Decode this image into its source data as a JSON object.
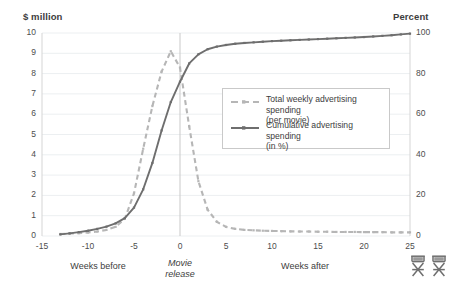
{
  "axes": {
    "left_title": "$ million",
    "right_title": "Percent",
    "left_ticks": [
      "10",
      "9",
      "8",
      "7",
      "6",
      "5",
      "4",
      "3",
      "2",
      "1",
      "0"
    ],
    "right_ticks": [
      "100",
      "80",
      "60",
      "40",
      "20",
      "0"
    ],
    "x_ticks": [
      "-15",
      "-10",
      "-5",
      "0",
      "5",
      "10",
      "15",
      "20",
      "25"
    ]
  },
  "annotations": {
    "weeks_before": "Weeks before",
    "movie_release_line1": "Movie",
    "movie_release_line2": "release",
    "weeks_after": "Weeks after",
    "chair_icon_1": "director-chair-icon",
    "chair_icon_2": "director-chair-icon"
  },
  "legend": {
    "items": [
      {
        "label_line1": "Total weekly advertising spending",
        "label_line2": "(per movie)",
        "style": "dashed",
        "color": "#b6b6b6"
      },
      {
        "label_line1": "Cumulative advertising spending",
        "label_line2": "(in %)",
        "style": "solid",
        "color": "#6e6e6e"
      }
    ]
  },
  "colors": {
    "weekly_line": "#b6b6b6",
    "cumulative_line": "#6e6e6e",
    "grid": "#eceff1",
    "axis": "#d5d5d5",
    "release_line": "#c9c9c9",
    "background": "#ffffff"
  },
  "chart_data": {
    "type": "line",
    "title": "",
    "subtitle": "",
    "xlabel": "Weeks relative to movie release",
    "ylabel": "$ million",
    "y2label": "Percent",
    "xlim": [
      -15,
      25
    ],
    "ylim": [
      0,
      10
    ],
    "y2lim": [
      0,
      100
    ],
    "grid": true,
    "legend_position": "upper-right",
    "reference_line_x": 0,
    "x": [
      -13,
      -12,
      -11,
      -10,
      -9,
      -8,
      -7,
      -6,
      -5,
      -4,
      -3,
      -2,
      -1,
      0,
      1,
      2,
      3,
      4,
      5,
      6,
      7,
      8,
      9,
      10,
      11,
      12,
      13,
      14,
      15,
      16,
      17,
      18,
      19,
      20,
      21,
      22,
      23,
      24,
      25
    ],
    "series": [
      {
        "name": "Total weekly advertising spending (per movie)",
        "unit": "$ million",
        "axis": "left",
        "style": "dashed",
        "values": [
          0.1,
          0.12,
          0.14,
          0.17,
          0.22,
          0.3,
          0.45,
          0.85,
          2.1,
          4.3,
          6.4,
          8.1,
          9.1,
          8.3,
          5.4,
          2.7,
          1.3,
          0.7,
          0.45,
          0.35,
          0.3,
          0.28,
          0.26,
          0.25,
          0.24,
          0.23,
          0.22,
          0.22,
          0.21,
          0.21,
          0.2,
          0.2,
          0.2,
          0.19,
          0.19,
          0.19,
          0.18,
          0.18,
          0.18
        ]
      },
      {
        "name": "Cumulative advertising spending (in %)",
        "unit": "percent",
        "axis": "right",
        "style": "solid",
        "values": [
          0.8,
          1.3,
          1.9,
          2.6,
          3.5,
          4.6,
          6.2,
          8.8,
          14.0,
          23.0,
          36.0,
          52.0,
          66.0,
          76.0,
          85.0,
          89.5,
          92.0,
          93.3,
          94.1,
          94.7,
          95.1,
          95.4,
          95.7,
          96.0,
          96.2,
          96.4,
          96.6,
          96.8,
          97.0,
          97.2,
          97.4,
          97.6,
          97.8,
          98.0,
          98.3,
          98.6,
          98.9,
          99.3,
          99.7
        ]
      }
    ]
  }
}
